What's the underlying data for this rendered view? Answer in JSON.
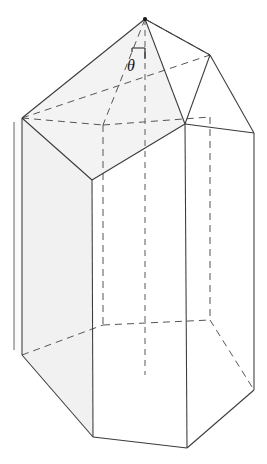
{
  "figure": {
    "shape_name": "hexagonal-prism",
    "angle_label": "θ",
    "background_color": "#ffffff",
    "line_color": "#3a3a3a",
    "hidden_line_color": "#555555",
    "shading_color": "#f4f4f4",
    "apex": {
      "x": 145,
      "y": 19
    },
    "vertices": {
      "apex_top": {
        "x": 145,
        "y": 19
      },
      "ridge_right": {
        "x": 210,
        "y": 55
      },
      "left_upper": {
        "x": 22,
        "y": 118
      },
      "right_upper": {
        "x": 254,
        "y": 133
      },
      "front_body_left": {
        "x": 92,
        "y": 180
      },
      "front_body_right": {
        "x": 185,
        "y": 124
      },
      "left_lower": {
        "x": 22,
        "y": 355
      },
      "right_lower": {
        "x": 254,
        "y": 390
      },
      "bottom_front_left": {
        "x": 93,
        "y": 437
      },
      "bottom_front_right": {
        "x": 187,
        "y": 448
      }
    },
    "marks": {
      "right_angle": "right-angle-square",
      "axis": "vertical-dashed-axis"
    }
  }
}
